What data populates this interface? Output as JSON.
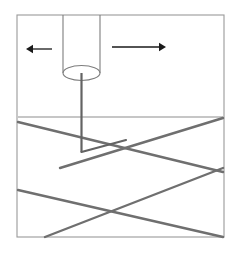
{
  "figure": {
    "type": "technical-line-diagram",
    "canvas": {
      "width": 234,
      "height": 254,
      "background": "#ffffff"
    },
    "colors": {
      "frame": "#9a9a9a",
      "surface_line": "#8d8d8d",
      "fiber_line": "#6f6f6f",
      "needle": "#636363",
      "cylinder": "#7d7d7d",
      "arrow": "#1a1a1a"
    },
    "frame": {
      "name": "diagram-border",
      "x": 17,
      "y": 15,
      "width": 207,
      "height": 222,
      "stroke_width": 1.1
    },
    "cylinder": {
      "name": "probe-cylinder",
      "left_x": 63,
      "right_x": 100,
      "top_y": 15,
      "bottom_center_y": 73,
      "ellipse_rx": 18.5,
      "ellipse_ry": 7.5,
      "stroke_width": 1.1
    },
    "needle": {
      "name": "probe-needle",
      "x": 81.5,
      "top_y": 73,
      "bottom_y": 152,
      "stroke_width": 2.2,
      "tip_notch": {
        "apex_x": 81.5,
        "apex_y": 152,
        "to_x": 126,
        "to_y": 140
      }
    },
    "arrows": [
      {
        "name": "arrow-left",
        "direction": "left",
        "tail_x": 52,
        "tail_y": 49,
        "head_x": 26,
        "head_y": 49,
        "head_size": 7,
        "stroke_width": 1.3
      },
      {
        "name": "arrow-right",
        "direction": "right",
        "tail_x": 112,
        "tail_y": 47,
        "head_x": 166,
        "head_y": 47,
        "head_size": 7,
        "stroke_width": 1.3
      }
    ],
    "surface_line": {
      "name": "substrate-surface-line",
      "x1": 18,
      "y1": 117,
      "x2": 223,
      "y2": 117,
      "stroke_width": 1.0
    },
    "fiber_lines": [
      {
        "name": "fiber-upper-descending",
        "x1": 18,
        "y1": 122,
        "x2": 223,
        "y2": 172,
        "stroke_width": 2.4
      },
      {
        "name": "fiber-upper-ascending",
        "x1": 60,
        "y1": 168,
        "x2": 223,
        "y2": 118,
        "stroke_width": 2.4
      },
      {
        "name": "fiber-lower-descending",
        "x1": 18,
        "y1": 190,
        "x2": 223,
        "y2": 237,
        "stroke_width": 2.4
      },
      {
        "name": "fiber-lower-ascending",
        "x1": 45,
        "y1": 237,
        "x2": 223,
        "y2": 168,
        "stroke_width": 2.4
      }
    ],
    "crossings": [
      {
        "name": "crossing-upper",
        "x": 126,
        "y": 148
      },
      {
        "name": "crossing-lower",
        "x": 123,
        "y": 212
      }
    ]
  }
}
